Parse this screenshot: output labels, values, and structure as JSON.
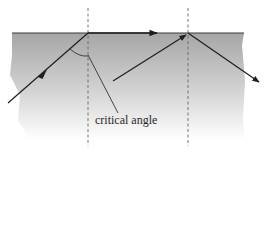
{
  "diagram": {
    "annotation": "critical angle",
    "colors": {
      "medium_top": "#a8a8a8",
      "medium_bottom": "#ffffff",
      "surface": "#3a3a3a",
      "ray": "#1e1e1e",
      "normal": "#666666",
      "leader": "#333333"
    },
    "elements": [
      {
        "name": "dense-medium",
        "type": "gradient-region"
      },
      {
        "name": "surface-line",
        "type": "boundary"
      },
      {
        "name": "normal-line-left",
        "type": "dashed-normal"
      },
      {
        "name": "normal-line-right",
        "type": "dashed-normal"
      },
      {
        "name": "incident-ray-critical",
        "type": "ray"
      },
      {
        "name": "refracted-ray-along-surface",
        "type": "ray"
      },
      {
        "name": "incident-ray-beyond-critical",
        "type": "ray"
      },
      {
        "name": "reflected-ray",
        "type": "ray"
      },
      {
        "name": "critical-angle-arc",
        "type": "arc"
      },
      {
        "name": "label-leader-line",
        "type": "leader"
      }
    ]
  }
}
